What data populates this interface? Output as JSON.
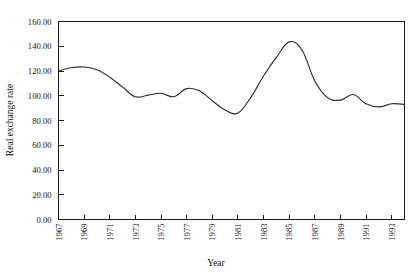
{
  "chart_data": {
    "type": "line",
    "title": "",
    "xlabel": "Year",
    "ylabel": "Real exchange rate",
    "xlim": [
      1967,
      1994
    ],
    "ylim": [
      0,
      160
    ],
    "grid": false,
    "legend": "none",
    "y_ticks": [
      0,
      20,
      40,
      60,
      80,
      100,
      120,
      140,
      160
    ],
    "y_tick_labels": [
      "0.00",
      "20.00",
      "40.00",
      "60.00",
      "80.00",
      "100.00",
      "120.00",
      "140.00",
      "160.00"
    ],
    "x_ticks": [
      1967,
      1969,
      1971,
      1973,
      1975,
      1977,
      1979,
      1981,
      1983,
      1985,
      1987,
      1989,
      1991,
      1993
    ],
    "x_tick_labels": [
      "1967",
      "1969",
      "1971",
      "1973",
      "1975",
      "1977",
      "1979",
      "1981",
      "1983",
      "1985",
      "1987",
      "1989",
      "1991",
      "1993"
    ],
    "x": [
      1967,
      1968,
      1969,
      1970,
      1971,
      1972,
      1973,
      1974,
      1975,
      1976,
      1977,
      1978,
      1979,
      1980,
      1981,
      1982,
      1983,
      1984,
      1985,
      1986,
      1987,
      1988,
      1989,
      1990,
      1991,
      1992,
      1993,
      1994
    ],
    "values": [
      120.0,
      122.6,
      123.2,
      121.0,
      115.0,
      107.0,
      99.2,
      100.5,
      102.0,
      99.2,
      105.8,
      104.0,
      96.0,
      88.5,
      86.0,
      98.5,
      116.0,
      131.0,
      143.5,
      137.0,
      112.0,
      98.5,
      96.5,
      101.0,
      93.5,
      91.0,
      93.5,
      93.0
    ],
    "series": [
      {
        "name": "Real exchange rate",
        "color": "#2b2b2b",
        "values": [
          120.0,
          122.6,
          123.2,
          121.0,
          115.0,
          107.0,
          99.2,
          100.5,
          102.0,
          99.2,
          105.8,
          104.0,
          96.0,
          88.5,
          86.0,
          98.5,
          116.0,
          131.0,
          143.5,
          137.0,
          112.0,
          98.5,
          96.5,
          101.0,
          93.5,
          91.0,
          93.5,
          93.0
        ]
      }
    ]
  },
  "axis": {
    "y_title": "Real exchange rate",
    "x_title": "Year"
  }
}
